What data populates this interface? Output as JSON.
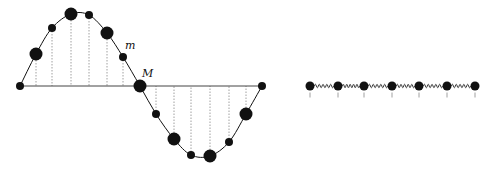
{
  "diagram": {
    "colors": {
      "ink": "#111111",
      "axis": "#444444",
      "guide": "#888888",
      "background": "#ffffff"
    },
    "wave_panel": {
      "axis": {
        "x1": 20,
        "x2": 262,
        "y": 86
      },
      "labels": {
        "small_mass": {
          "text": "m",
          "x": 125,
          "y": 49
        },
        "large_mass": {
          "text": "M",
          "x": 142,
          "y": 77
        }
      },
      "curve_points": [
        [
          20,
          86
        ],
        [
          36,
          54
        ],
        [
          52,
          28
        ],
        [
          71,
          14
        ],
        [
          89,
          15
        ],
        [
          107,
          33
        ],
        [
          123,
          57
        ],
        [
          140,
          86
        ],
        [
          156,
          114
        ],
        [
          174,
          139
        ],
        [
          191,
          155
        ],
        [
          210,
          156
        ],
        [
          229,
          142
        ],
        [
          246,
          114
        ],
        [
          262,
          86
        ]
      ],
      "beads": [
        {
          "x": 20,
          "y": 86,
          "size": "small"
        },
        {
          "x": 36,
          "y": 54,
          "size": "large"
        },
        {
          "x": 52,
          "y": 28,
          "size": "small"
        },
        {
          "x": 71,
          "y": 14,
          "size": "large"
        },
        {
          "x": 89,
          "y": 15,
          "size": "small"
        },
        {
          "x": 107,
          "y": 33,
          "size": "large"
        },
        {
          "x": 123,
          "y": 57,
          "size": "small"
        },
        {
          "x": 140,
          "y": 86,
          "size": "large"
        },
        {
          "x": 156,
          "y": 114,
          "size": "small"
        },
        {
          "x": 174,
          "y": 139,
          "size": "large"
        },
        {
          "x": 191,
          "y": 155,
          "size": "small"
        },
        {
          "x": 210,
          "y": 156,
          "size": "large"
        },
        {
          "x": 229,
          "y": 142,
          "size": "small"
        },
        {
          "x": 246,
          "y": 114,
          "size": "large"
        },
        {
          "x": 262,
          "y": 86,
          "size": "small"
        }
      ],
      "radii": {
        "small": 4,
        "large": 6.5
      }
    },
    "spring_panel": {
      "y": 86,
      "beads_x": [
        310,
        338,
        364,
        392,
        419,
        447,
        475
      ],
      "bead_radius": 4.5,
      "tick_length": 5,
      "coil_count": 5,
      "coil_amplitude": 3.5
    }
  }
}
